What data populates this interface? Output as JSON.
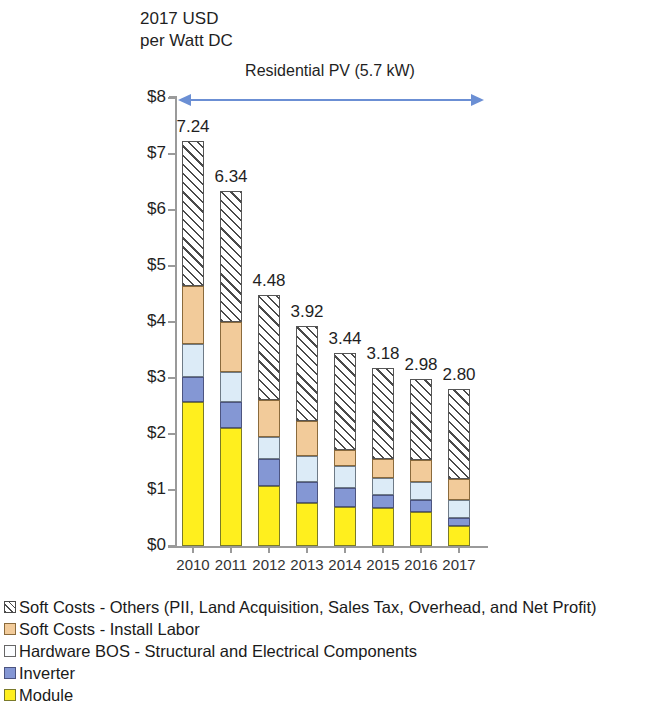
{
  "axis_title": "2017 USD\nper Watt DC",
  "span_label": "Residential PV (5.7 kW)",
  "accent_color": "#6b8fd4",
  "chart_data": {
    "type": "bar",
    "subtype": "stacked-bar",
    "title": "Residential PV (5.7 kW)",
    "xlabel": "",
    "ylabel": "2017 USD per Watt DC",
    "ylim": [
      0,
      8
    ],
    "ytick_labels": [
      "$0",
      "$1",
      "$2",
      "$3",
      "$4",
      "$5",
      "$6",
      "$7",
      "$8"
    ],
    "ytick_values": [
      0,
      1,
      2,
      3,
      4,
      5,
      6,
      7,
      8
    ],
    "grid": false,
    "legend_position": "below",
    "categories": [
      "2010",
      "2011",
      "2012",
      "2013",
      "2014",
      "2015",
      "2016",
      "2017"
    ],
    "totals": [
      7.24,
      6.34,
      4.48,
      3.92,
      3.44,
      3.18,
      2.98,
      2.8
    ],
    "total_labels": [
      "7.24",
      "6.34",
      "4.48",
      "3.92",
      "3.44",
      "3.18",
      "2.98",
      "2.80"
    ],
    "series": [
      {
        "name": "Module",
        "key": "module",
        "color": "#ffef1e",
        "values": [
          2.57,
          2.11,
          1.08,
          0.76,
          0.7,
          0.67,
          0.61,
          0.35
        ]
      },
      {
        "name": "Inverter",
        "key": "inverter",
        "color": "#8497d4",
        "values": [
          0.45,
          0.47,
          0.47,
          0.38,
          0.33,
          0.24,
          0.21,
          0.15
        ]
      },
      {
        "name": "Hardware BOS - Structural and Electrical Components",
        "key": "bos",
        "color": "#dcebf7",
        "values": [
          0.59,
          0.53,
          0.4,
          0.47,
          0.4,
          0.3,
          0.33,
          0.33
        ]
      },
      {
        "name": "Soft Costs - Install Labor",
        "key": "labor",
        "color": "#f2cb9a",
        "values": [
          1.04,
          0.89,
          0.65,
          0.63,
          0.29,
          0.34,
          0.38,
          0.36
        ]
      },
      {
        "name": "Soft Costs - Others (PII, Land Acquisition, Sales Tax, Overhead, and Net Profit)",
        "key": "soft",
        "color": "#ffffff",
        "hatch": true,
        "values": [
          2.59,
          2.34,
          1.88,
          1.68,
          1.72,
          1.63,
          1.45,
          1.61
        ]
      }
    ],
    "legend": [
      {
        "label": "Soft Costs - Others (PII, Land Acquisition, Sales Tax, Overhead, and Net Profit)",
        "key": "soft"
      },
      {
        "label": "Soft Costs - Install Labor",
        "key": "labor"
      },
      {
        "label": "Hardware BOS - Structural and Electrical Components",
        "key": "bos"
      },
      {
        "label": "Inverter",
        "key": "inverter"
      },
      {
        "label": "Module",
        "key": "module"
      }
    ]
  }
}
